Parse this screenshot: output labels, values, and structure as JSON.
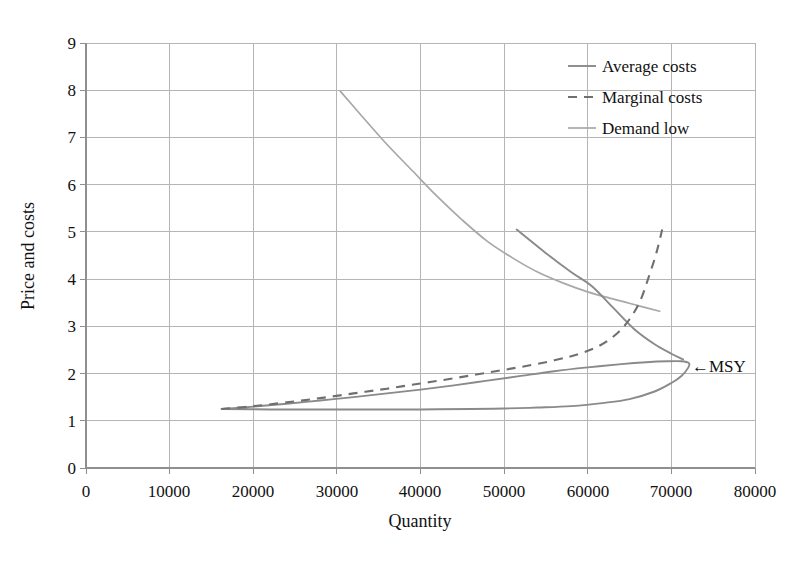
{
  "chart_data": {
    "type": "line",
    "title": "",
    "xlabel": "Quantity",
    "ylabel": "Price and costs",
    "xlim": [
      0,
      80000
    ],
    "ylim": [
      0,
      9
    ],
    "grid": true,
    "legend_position": "top-right",
    "x_ticks": [
      "0",
      "10000",
      "20000",
      "30000",
      "40000",
      "50000",
      "60000",
      "70000",
      "80000"
    ],
    "y_ticks": [
      "0",
      "1",
      "2",
      "3",
      "4",
      "5",
      "6",
      "7",
      "8",
      "9"
    ],
    "annotations": [
      {
        "text": "←MSY",
        "x": 72000,
        "y": 2.25,
        "note": "Maximum Sustainable Yield point at the backward bend of the average cost curve"
      }
    ],
    "series": [
      {
        "name": "Average costs",
        "style": "solid",
        "color": "#8a8a8a",
        "points": [
          [
            16200,
            1.25
          ],
          [
            18000,
            1.27
          ],
          [
            20000,
            1.3
          ],
          [
            24000,
            1.36
          ],
          [
            28000,
            1.43
          ],
          [
            32000,
            1.5
          ],
          [
            36000,
            1.58
          ],
          [
            40000,
            1.66
          ],
          [
            44000,
            1.75
          ],
          [
            48000,
            1.85
          ],
          [
            52000,
            1.95
          ],
          [
            56000,
            2.05
          ],
          [
            60000,
            2.13
          ],
          [
            64000,
            2.2
          ],
          [
            67000,
            2.24
          ],
          [
            69500,
            2.26
          ],
          [
            71200,
            2.26
          ],
          [
            72100,
            2.22
          ],
          [
            72000,
            2.12
          ],
          [
            71200,
            1.95
          ],
          [
            70000,
            1.8
          ],
          [
            68000,
            1.62
          ],
          [
            65000,
            1.46
          ],
          [
            62000,
            1.38
          ],
          [
            58000,
            1.31
          ],
          [
            54000,
            1.28
          ],
          [
            50000,
            1.26
          ],
          [
            46000,
            1.25
          ],
          [
            40000,
            1.24
          ],
          [
            34000,
            1.24
          ],
          [
            28000,
            1.24
          ],
          [
            22000,
            1.24
          ],
          [
            16200,
            1.25
          ]
        ]
      },
      {
        "name": "Average costs upper branch",
        "style": "solid",
        "color": "#8a8a8a",
        "points": [
          [
            51500,
            5.05
          ],
          [
            55000,
            4.55
          ],
          [
            58000,
            4.15
          ],
          [
            60500,
            3.85
          ],
          [
            63000,
            3.4
          ],
          [
            65500,
            2.95
          ],
          [
            68000,
            2.62
          ],
          [
            70000,
            2.42
          ],
          [
            71400,
            2.3
          ]
        ]
      },
      {
        "name": "Marginal costs",
        "style": "dashed",
        "color": "#6f6f6f",
        "points": [
          [
            16200,
            1.25
          ],
          [
            20000,
            1.31
          ],
          [
            24000,
            1.39
          ],
          [
            28000,
            1.48
          ],
          [
            32000,
            1.58
          ],
          [
            36000,
            1.68
          ],
          [
            40000,
            1.79
          ],
          [
            44000,
            1.9
          ],
          [
            48000,
            2.02
          ],
          [
            52000,
            2.14
          ],
          [
            56000,
            2.28
          ],
          [
            59000,
            2.42
          ],
          [
            61500,
            2.6
          ],
          [
            63500,
            2.85
          ],
          [
            65000,
            3.15
          ],
          [
            66300,
            3.55
          ],
          [
            67300,
            4.05
          ],
          [
            68200,
            4.55
          ],
          [
            68900,
            5.05
          ]
        ]
      },
      {
        "name": "Demand low",
        "style": "solid",
        "color": "#a8a8a8",
        "points": [
          [
            30400,
            7.98
          ],
          [
            33000,
            7.45
          ],
          [
            36000,
            6.85
          ],
          [
            39000,
            6.3
          ],
          [
            42000,
            5.75
          ],
          [
            45000,
            5.25
          ],
          [
            48000,
            4.8
          ],
          [
            51000,
            4.45
          ],
          [
            54000,
            4.15
          ],
          [
            57000,
            3.92
          ],
          [
            60000,
            3.73
          ],
          [
            63000,
            3.58
          ],
          [
            66000,
            3.44
          ],
          [
            68600,
            3.32
          ]
        ]
      }
    ],
    "legend": [
      {
        "label": "Average costs",
        "style": "solid",
        "color": "#8a8a8a"
      },
      {
        "label": "Marginal costs",
        "style": "dashed",
        "color": "#6f6f6f"
      },
      {
        "label": "Demand low",
        "style": "solid",
        "color": "#a8a8a8"
      }
    ]
  },
  "axes": {
    "x_title": "Quantity",
    "y_title": "Price and costs"
  },
  "ticks": {
    "x": [
      "0",
      "10000",
      "20000",
      "30000",
      "40000",
      "50000",
      "60000",
      "70000",
      "80000"
    ],
    "y": [
      "9",
      "8",
      "7",
      "6",
      "5",
      "4",
      "3",
      "2",
      "1",
      "0"
    ]
  },
  "legend": {
    "items": [
      {
        "label": "Average costs"
      },
      {
        "label": "Marginal costs"
      },
      {
        "label": "Demand low"
      }
    ]
  },
  "annotation": {
    "msy": "←MSY"
  },
  "colors": {
    "grid": "#b5b5b5",
    "axis": "#8f8f8f",
    "average": "#8a8a8a",
    "marginal": "#6f6f6f",
    "demand": "#a8a8a8",
    "text": "#111111"
  }
}
